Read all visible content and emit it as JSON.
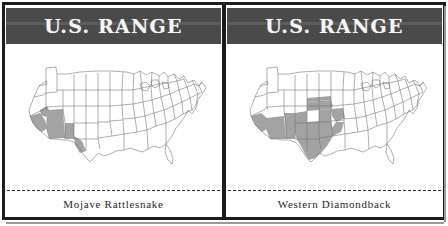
{
  "figure": {
    "panel_count": 2,
    "frame_color": "#1c1c1c",
    "background_color": "#ffffff"
  },
  "panels": [
    {
      "id": "mojave-rattlesnake",
      "header_title": "U.S. RANGE",
      "header_bg_color": "#4a4a4a",
      "header_text_color": "#f5f5f5",
      "caption": "Mojave Rattlesnake",
      "map": {
        "type": "choropleth-range-map",
        "region": "United States (contiguous 48 states)",
        "outline_color": "#6e6e6e",
        "range_fill_color": "#a3a3a3",
        "unshaded_fill_color": "#ffffff",
        "range_states": [
          "California (southeastern)",
          "Nevada (southern tip)",
          "Arizona",
          "New Mexico (southwestern)",
          "Texas (far west)"
        ],
        "range_description": "Desert Southwest: southeastern California, southern Nevada, most of Arizona, southwestern New Mexico, and far west Texas"
      }
    },
    {
      "id": "western-diamondback",
      "header_title": "U.S. RANGE",
      "header_bg_color": "#4a4a4a",
      "header_text_color": "#f5f5f5",
      "caption": "Western Diamondback",
      "map": {
        "type": "choropleth-range-map",
        "region": "United States (contiguous 48 states)",
        "outline_color": "#6e6e6e",
        "range_fill_color": "#a3a3a3",
        "unshaded_fill_color": "#ffffff",
        "range_states": [
          "California (southeastern)",
          "Arizona (southern)",
          "New Mexico",
          "Texas",
          "Oklahoma",
          "Arkansas (western)",
          "Kansas (southern edge)"
        ],
        "range_description": "Broad southern band: southeastern California, southern Arizona, New Mexico, all of Texas, Oklahoma, and into western Arkansas"
      }
    }
  ]
}
